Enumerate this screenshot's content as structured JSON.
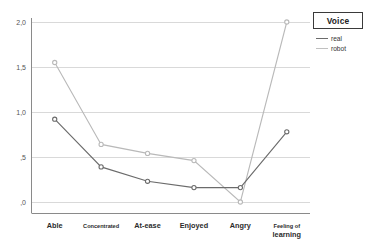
{
  "chart_data": {
    "type": "line",
    "title": "",
    "xlabel": "",
    "ylabel": "",
    "categories": [
      "Able",
      "Concentrated",
      "At-ease",
      "Enjoyed",
      "Angry",
      "Feeling of\nlearning"
    ],
    "series": [
      {
        "name": "real",
        "color": "#6b6b6b",
        "values": [
          0.92,
          0.39,
          0.23,
          0.16,
          0.16,
          0.78
        ]
      },
      {
        "name": "robot",
        "color": "#b9b9b9",
        "values": [
          1.55,
          0.64,
          0.54,
          0.46,
          0.0,
          2.0
        ]
      }
    ],
    "ylim": [
      -0.08,
      2.13
    ],
    "ytick_values": [
      2.0,
      1.5,
      1.0,
      0.5,
      0.0
    ],
    "ytick_labels": [
      "2,0",
      "1,5",
      "1,0",
      ",5",
      ",0"
    ],
    "grid": true,
    "grid_color": "#d9d9d9",
    "axis_color": "#808080",
    "legend_position": "top-right"
  },
  "legend": {
    "title": "Voice",
    "entries": [
      {
        "label": "real",
        "color": "#6b6b6b"
      },
      {
        "label": "robot",
        "color": "#c0c0c0"
      }
    ]
  },
  "axis": {
    "ytick_labels": [
      "2,0",
      "1,5",
      "1,0",
      ",5",
      ",0"
    ],
    "category_labels": [
      "Able",
      "Concentrated",
      "At-ease",
      "Enjoyed",
      "Angry",
      "Feeling of",
      "learning"
    ]
  }
}
